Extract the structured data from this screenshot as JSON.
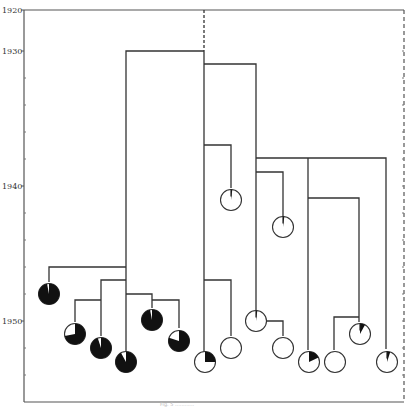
{
  "diagram": {
    "type": "dendrogram-with-pie-leaves",
    "colors": {
      "line": "#333333",
      "fill_dark": "#111111",
      "fill_light": "#ffffff",
      "frame": "#555555"
    },
    "y_axis": {
      "ticks": [
        {
          "label": "1920",
          "y": 10
        },
        {
          "label": "1930",
          "y": 51
        },
        {
          "label": "1940",
          "y": 186
        },
        {
          "label": "1950",
          "y": 321
        }
      ],
      "minor_tick_ys": [
        78,
        105,
        132,
        159,
        213,
        240,
        267,
        294,
        348,
        375
      ]
    },
    "caption": "Fig. 5 ............"
  },
  "chart_data": {
    "type": "dendrogram",
    "title": "",
    "ylabel": "Year",
    "ylim": [
      1920,
      1955
    ],
    "y_tick_labels": [
      "1920",
      "1930",
      "1940",
      "1950"
    ],
    "groups": [
      {
        "name": "left-clade (dark, mostly filled)",
        "root_split_year": 1930,
        "leaves": [
          {
            "id": "L1",
            "year": 1948,
            "fraction_filled": 0.97
          },
          {
            "id": "L2",
            "year": 1951,
            "fraction_filled": 0.72
          },
          {
            "id": "L3",
            "year": 1952,
            "fraction_filled": 0.95
          },
          {
            "id": "L4",
            "year": 1953,
            "fraction_filled": 0.92
          },
          {
            "id": "L5",
            "year": 1950,
            "fraction_filled": 0.97
          },
          {
            "id": "L6",
            "year": 1951.5,
            "fraction_filled": 0.8
          }
        ]
      },
      {
        "name": "right-clade (light, mostly empty)",
        "root_split_year": 1931,
        "leaves": [
          {
            "id": "R1",
            "year": 1953,
            "fraction_filled": 0.25
          },
          {
            "id": "R2",
            "year": 1952,
            "fraction_filled": 0.0
          },
          {
            "id": "R3",
            "year": 1939,
            "fraction_filled": 0.02
          },
          {
            "id": "R4",
            "year": 1950,
            "fraction_filled": 0.02
          },
          {
            "id": "R5",
            "year": 1952,
            "fraction_filled": 0.0
          },
          {
            "id": "R6",
            "year": 1941,
            "fraction_filled": 0.02
          },
          {
            "id": "R7",
            "year": 1953,
            "fraction_filled": 0.18
          },
          {
            "id": "R8",
            "year": 1953,
            "fraction_filled": 0.0
          },
          {
            "id": "R9",
            "year": 1951,
            "fraction_filled": 0.08
          },
          {
            "id": "R10",
            "year": 1953,
            "fraction_filled": 0.05
          }
        ]
      }
    ]
  }
}
